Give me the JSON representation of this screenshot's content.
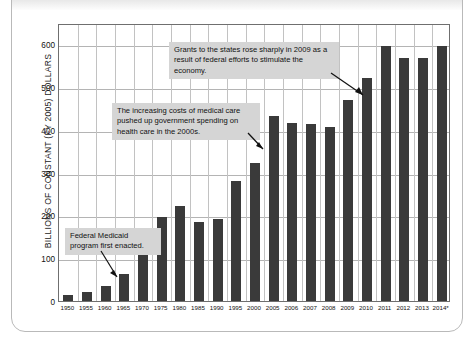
{
  "chart_data": {
    "type": "bar",
    "title": "",
    "subtitle": "",
    "xlabel": "",
    "ylabel": "BILLIONS OF CONSTANT (FY 2005) DOLLARS",
    "ylim": [
      0,
      650
    ],
    "yticks": [
      0,
      100,
      200,
      300,
      400,
      500,
      600
    ],
    "ytick_labels": [
      "0",
      "100",
      "200",
      "300",
      "400",
      "500",
      "600"
    ],
    "grid": "horizontal-and-vertical",
    "legend": "none",
    "bar_color": "#3a3a3a",
    "categories": [
      "1950",
      "1955",
      "1960",
      "1965",
      "1970",
      "1975",
      "1980",
      "1985",
      "1990",
      "1995",
      "2000",
      "2005",
      "2006",
      "2007",
      "2008",
      "2009",
      "2010",
      "2011",
      "2012",
      "2013",
      "2014*"
    ],
    "values": [
      15,
      20,
      35,
      63,
      122,
      196,
      222,
      184,
      192,
      281,
      323,
      432,
      417,
      415,
      408,
      470,
      522,
      597,
      568,
      568,
      597
    ],
    "annotations": [
      {
        "id": "annotation-grants",
        "text": "Grants to the states rose sharply in 2009 as a result of federal efforts to stimulate the economy.",
        "points_to": "2009"
      },
      {
        "id": "annotation-medical-costs",
        "text": "The increasing costs of medical care pushed up government spending on health care in the 2000s.",
        "points_to": "2005"
      },
      {
        "id": "annotation-medicaid",
        "text": "Federal Medicaid program first enacted.",
        "points_to": "1965"
      }
    ]
  }
}
